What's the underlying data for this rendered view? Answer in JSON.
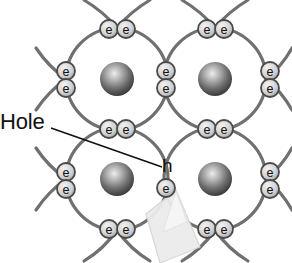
{
  "diagram": {
    "title_label": "Hole",
    "hole_marker_label": "h",
    "electron_label": "e",
    "colors": {
      "background": "#ffffff",
      "orbital_stroke": "#6f6f6f",
      "electron_stroke": "#4a4a4a",
      "electron_fill": "#d9d9d9",
      "electron_text": "#111111",
      "nucleus_dark": "#3a3a3a",
      "nucleus_light": "#e8e8e8",
      "leader_line": "#111111",
      "label_text": "#111111",
      "arrow_fill": "#e3e3e3",
      "arrow_stroke": "#c8c8c8"
    },
    "atoms": [
      {
        "name": "atom-top-left",
        "cx": 117,
        "cy": 79,
        "r": 51
      },
      {
        "name": "atom-top-right",
        "cx": 215,
        "cy": 79,
        "r": 51
      },
      {
        "name": "atom-bottom-left",
        "cx": 117,
        "cy": 179,
        "r": 51
      },
      {
        "name": "atom-bottom-right",
        "cx": 215,
        "cy": 179,
        "r": 51
      }
    ],
    "nuclei": [
      {
        "name": "nucleus-top-left",
        "cx": 117,
        "cy": 79,
        "r": 17
      },
      {
        "name": "nucleus-top-right",
        "cx": 215,
        "cy": 79,
        "r": 17
      },
      {
        "name": "nucleus-bottom-left",
        "cx": 117,
        "cy": 179,
        "r": 17
      },
      {
        "name": "nucleus-bottom-right",
        "cx": 215,
        "cy": 179,
        "r": 17
      }
    ],
    "electrons": [
      {
        "name": "electron-top-row-left-a",
        "cx": 109,
        "cy": 29,
        "r": 9
      },
      {
        "name": "electron-top-row-left-b",
        "cx": 126,
        "cy": 29,
        "r": 9
      },
      {
        "name": "electron-top-row-right-a",
        "cx": 207,
        "cy": 29,
        "r": 9
      },
      {
        "name": "electron-top-row-right-b",
        "cx": 224,
        "cy": 29,
        "r": 9
      },
      {
        "name": "electron-left-edge-upper",
        "cx": 66,
        "cy": 71,
        "r": 9
      },
      {
        "name": "electron-left-edge-lower",
        "cx": 66,
        "cy": 88,
        "r": 9
      },
      {
        "name": "electron-center-upper",
        "cx": 166,
        "cy": 71,
        "r": 9
      },
      {
        "name": "electron-center-lower",
        "cx": 166,
        "cy": 88,
        "r": 9
      },
      {
        "name": "electron-right-edge-upper",
        "cx": 270,
        "cy": 71,
        "r": 9
      },
      {
        "name": "electron-right-edge-lower",
        "cx": 270,
        "cy": 88,
        "r": 9
      },
      {
        "name": "electron-middle-row-left-a",
        "cx": 109,
        "cy": 129,
        "r": 9
      },
      {
        "name": "electron-middle-row-left-b",
        "cx": 126,
        "cy": 129,
        "r": 9
      },
      {
        "name": "electron-middle-row-right-a",
        "cx": 207,
        "cy": 129,
        "r": 9
      },
      {
        "name": "electron-middle-row-right-b",
        "cx": 224,
        "cy": 129,
        "r": 9
      },
      {
        "name": "electron-left-edge-lower2-up",
        "cx": 66,
        "cy": 172,
        "r": 9
      },
      {
        "name": "electron-left-edge-lower2-dn",
        "cx": 66,
        "cy": 189,
        "r": 9
      },
      {
        "name": "electron-hole-site-lower",
        "cx": 166,
        "cy": 188,
        "r": 9
      },
      {
        "name": "electron-right-edge-low-up",
        "cx": 270,
        "cy": 172,
        "r": 9
      },
      {
        "name": "electron-right-edge-low-dn",
        "cx": 270,
        "cy": 189,
        "r": 9
      },
      {
        "name": "electron-bottom-row-left-a",
        "cx": 109,
        "cy": 229,
        "r": 9
      },
      {
        "name": "electron-bottom-row-left-b",
        "cx": 126,
        "cy": 229,
        "r": 9
      },
      {
        "name": "electron-bottom-row-right-a",
        "cx": 207,
        "cy": 229,
        "r": 9
      },
      {
        "name": "electron-bottom-row-right-b",
        "cx": 224,
        "cy": 229,
        "r": 9
      }
    ],
    "hole_marker": {
      "x": 162,
      "y": 172
    },
    "leader_line": {
      "x1": 51,
      "y1": 128,
      "x2": 162,
      "y2": 167
    }
  }
}
